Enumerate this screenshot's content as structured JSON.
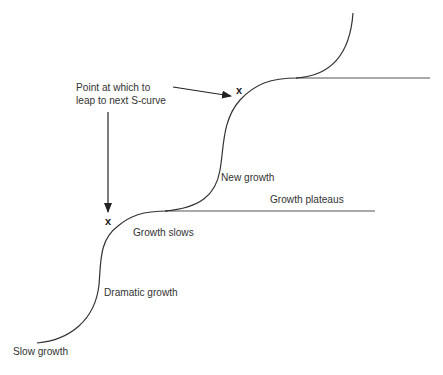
{
  "diagram": {
    "type": "two successive S-curves with leap points",
    "colors": {
      "line": "#333333",
      "text": "#333333",
      "background": "#ffffff"
    },
    "labels": {
      "leap_point_line1": "Point at which to",
      "leap_point_line2": "leap to next S-curve",
      "slow_growth": "Slow growth",
      "dramatic_growth": "Dramatic growth",
      "growth_slows": "Growth slows",
      "growth_plateaus": "Growth plateaus",
      "new_growth": "New growth"
    },
    "markers": {
      "lower_leap_point": "x",
      "upper_leap_point": "x"
    }
  }
}
